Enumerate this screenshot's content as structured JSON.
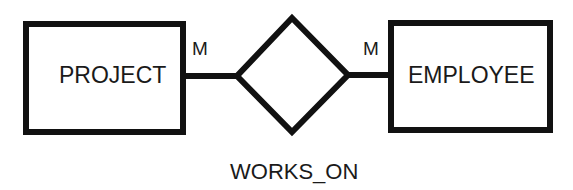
{
  "diagram": {
    "type": "er-diagram",
    "colors": {
      "stroke": "#111111",
      "text": "#1a1a1a",
      "background": "#ffffff"
    },
    "entities": [
      {
        "id": "project",
        "label": "PROJECT"
      },
      {
        "id": "employee",
        "label": "EMPLOYEE"
      }
    ],
    "relationship": {
      "id": "works_on",
      "label": "WORKS_ON"
    },
    "cardinalities": [
      {
        "side": "project",
        "label": "M"
      },
      {
        "side": "employee",
        "label": "M"
      }
    ]
  }
}
